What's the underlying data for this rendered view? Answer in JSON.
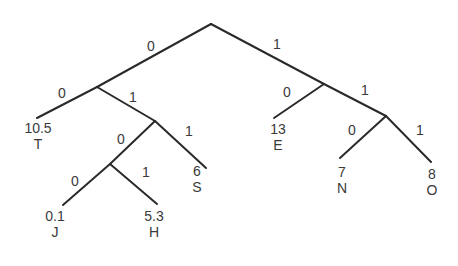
{
  "diagram": {
    "type": "huffman-code-tree",
    "nodes": {
      "root": {
        "x": 211,
        "y": 24
      },
      "n0": {
        "x": 97,
        "y": 87
      },
      "n01": {
        "x": 155,
        "y": 121
      },
      "n010": {
        "x": 110,
        "y": 164
      },
      "n1": {
        "x": 324,
        "y": 84
      },
      "n11": {
        "x": 386,
        "y": 116
      }
    },
    "edges": [
      {
        "from": "root",
        "to": "n0",
        "bit": "0",
        "bx": 151,
        "by": 46
      },
      {
        "from": "root",
        "to": "n1",
        "bit": "1",
        "bx": 277,
        "by": 44
      },
      {
        "from": "n0",
        "to": "T",
        "bit": "0",
        "bx": 62,
        "by": 93
      },
      {
        "from": "n0",
        "to": "n01",
        "bit": "1",
        "bx": 133,
        "by": 97
      },
      {
        "from": "n01",
        "to": "n010",
        "bit": "0",
        "bx": 121,
        "by": 139
      },
      {
        "from": "n01",
        "to": "S",
        "bit": "1",
        "bx": 189,
        "by": 131
      },
      {
        "from": "n010",
        "to": "J",
        "bit": "0",
        "bx": 75,
        "by": 181
      },
      {
        "from": "n010",
        "to": "H",
        "bit": "1",
        "bx": 146,
        "by": 172
      },
      {
        "from": "n1",
        "to": "E",
        "bit": "0",
        "bx": 287,
        "by": 92
      },
      {
        "from": "n1",
        "to": "n11",
        "bit": "1",
        "bx": 365,
        "by": 90
      },
      {
        "from": "n11",
        "to": "N",
        "bit": "0",
        "bx": 352,
        "by": 130
      },
      {
        "from": "n11",
        "to": "O",
        "bit": "1",
        "bx": 420,
        "by": 130
      }
    ],
    "leaves": [
      {
        "id": "T",
        "char": "T",
        "weight": "10.5",
        "x": 37,
        "y": 118,
        "lx": 38,
        "ly": 120
      },
      {
        "id": "S",
        "char": "S",
        "weight": "6",
        "x": 206,
        "y": 168,
        "lx": 197,
        "ly": 163
      },
      {
        "id": "J",
        "char": "J",
        "weight": "0.1",
        "x": 63,
        "y": 205,
        "lx": 55,
        "ly": 208
      },
      {
        "id": "H",
        "char": "H",
        "weight": "5.3",
        "x": 157,
        "y": 204,
        "lx": 154,
        "ly": 208
      },
      {
        "id": "E",
        "char": "E",
        "weight": "13",
        "x": 274,
        "y": 118,
        "lx": 278,
        "ly": 121
      },
      {
        "id": "N",
        "char": "N",
        "weight": "7",
        "x": 340,
        "y": 158,
        "lx": 342,
        "ly": 164
      },
      {
        "id": "O",
        "char": "O",
        "weight": "8",
        "x": 431,
        "y": 162,
        "lx": 432,
        "ly": 166
      }
    ],
    "colors": {
      "line": "#2a2a2a",
      "text": "#3a3a3a",
      "background": "#ffffff"
    }
  }
}
